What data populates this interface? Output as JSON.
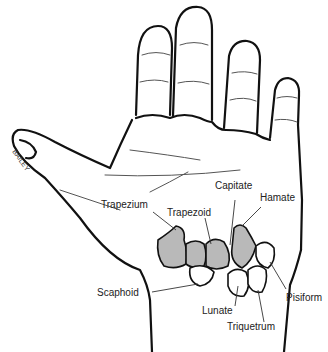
{
  "figure": {
    "signature": "BAILEY"
  },
  "labels": {
    "capitate": "Capitate",
    "hamate": "Hamate",
    "trapezium": "Trapezium",
    "trapezoid": "Trapezoid",
    "scaphoid": "Scaphoid",
    "lunate": "Lunate",
    "triquetrum": "Triquetrum",
    "pisiform": "Pisiform"
  },
  "colors": {
    "shaded_bone": "#b9b9b9",
    "outline": "#111111",
    "background": "#ffffff"
  }
}
